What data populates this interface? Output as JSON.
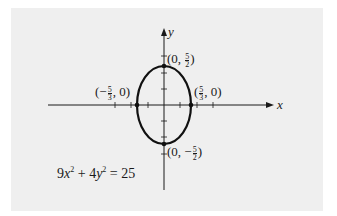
{
  "figure": {
    "axis_labels": {
      "x": "x",
      "y": "y"
    },
    "equation": {
      "coef_x": "9",
      "var_x": "x",
      "exp": "2",
      "plus": "+",
      "coef_y": "4",
      "var_y": "y",
      "equals": "=",
      "rhs": "25"
    },
    "points": {
      "top": {
        "prefix": "(0, ",
        "num": "5",
        "den": "2",
        "suffix": ")"
      },
      "bottom": {
        "prefix": "(0, −",
        "num": "5",
        "den": "2",
        "suffix": ")"
      },
      "left": {
        "prefix": "(−",
        "num": "5",
        "den": "3",
        "suffix": ", 0)"
      },
      "right": {
        "prefix": "(",
        "num": "5",
        "den": "3",
        "suffix": ", 0)"
      }
    },
    "colors": {
      "background": "#efefef",
      "ink": "#1a1a1a"
    }
  }
}
